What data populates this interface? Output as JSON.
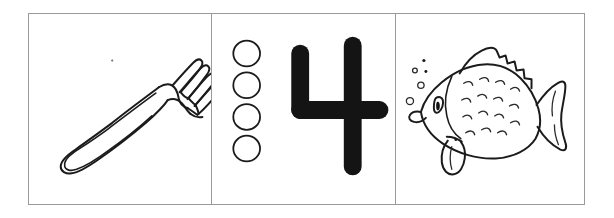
{
  "sheet": {
    "title": "Number Four Flashcard",
    "background_color": "#ffffff",
    "border_color": "#9a9a9a",
    "ink_color": "#1b1b1b",
    "panel_count": 3
  },
  "panels": [
    {
      "id": "fork-panel",
      "name": "fork-illustration-panel",
      "subject": "fork",
      "icon_name": "fork-icon",
      "style": "line-art outline",
      "detail": "dinner fork angled diagonally, handle at lower left, head with four tines at upper right",
      "tine_count": 4,
      "caption": ""
    },
    {
      "id": "count-panel",
      "name": "counting-panel",
      "subject": "four circles and numeral four",
      "icon_name": "circle-tally-icon",
      "circle_count": 4,
      "numeral": "4",
      "numeral_style": "bold rounded black brush strokes",
      "caption": ""
    },
    {
      "id": "fish-panel",
      "name": "fish-illustration-panel",
      "subject": "fish",
      "icon_name": "fish-icon",
      "style": "line-art outline",
      "detail": "fish facing left with bubbles, eye, gill, scales, spiky dorsal fin, fan tail and belly fin",
      "bubble_count": 5,
      "caption": ""
    }
  ],
  "counting": {
    "pips": [
      "circle-1",
      "circle-2",
      "circle-3",
      "circle-4"
    ],
    "numeral_value": "4"
  },
  "bubbles": [
    {
      "label": "bubble-1",
      "size": "tiny"
    },
    {
      "label": "bubble-2",
      "size": "tiny"
    },
    {
      "label": "bubble-3",
      "size": "small"
    },
    {
      "label": "bubble-4",
      "size": "small"
    },
    {
      "label": "bubble-5",
      "size": "medium"
    }
  ]
}
